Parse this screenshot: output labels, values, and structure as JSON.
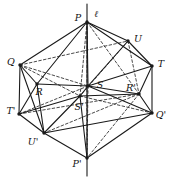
{
  "figure": {
    "type": "geometric-diagram",
    "stroke_color": "#1a1a1a",
    "background_color": "#ffffff",
    "width": 172,
    "height": 180,
    "axis": {
      "label": "ℓ",
      "label_x": 96,
      "label_y": 14,
      "x": 87,
      "y_top": 4,
      "y_bottom": 176
    },
    "points": [
      {
        "id": "P",
        "label": "P",
        "x": 87,
        "y": 22,
        "lx": 78,
        "ly": 18,
        "dot": true
      },
      {
        "id": "Q",
        "label": "Q",
        "x": 20,
        "y": 65,
        "lx": 11,
        "ly": 62,
        "dot": true
      },
      {
        "id": "U",
        "label": "U",
        "x": 128,
        "y": 41,
        "lx": 138,
        "ly": 39,
        "dot": true
      },
      {
        "id": "T",
        "label": "T",
        "x": 152,
        "y": 66,
        "lx": 161,
        "ly": 64,
        "dot": true
      },
      {
        "id": "R",
        "label": "R",
        "x": 37,
        "y": 84,
        "lx": 39,
        "ly": 92,
        "dot": true
      },
      {
        "id": "S",
        "label": "S",
        "x": 88,
        "y": 86,
        "lx": 100,
        "ly": 85,
        "dot": true
      },
      {
        "id": "Rp",
        "label": "R'",
        "x": 139,
        "y": 94,
        "lx": 131,
        "ly": 88,
        "dot": true
      },
      {
        "id": "Sp",
        "label": "S'",
        "x": 80,
        "y": 96,
        "lx": 79,
        "ly": 107,
        "dot": true
      },
      {
        "id": "Tp",
        "label": "T'",
        "x": 19,
        "y": 114,
        "lx": 11,
        "ly": 111,
        "dot": true
      },
      {
        "id": "Up",
        "label": "U'",
        "x": 44,
        "y": 133,
        "lx": 33,
        "ly": 142,
        "dot": true
      },
      {
        "id": "Qp",
        "label": "Q'",
        "x": 152,
        "y": 113,
        "lx": 161,
        "ly": 115,
        "dot": true
      },
      {
        "id": "Pp",
        "label": "P'",
        "x": 87,
        "y": 158,
        "lx": 77,
        "ly": 164,
        "dot": true
      }
    ],
    "solid_edges": [
      [
        "P",
        "Q"
      ],
      [
        "P",
        "U"
      ],
      [
        "P",
        "T"
      ],
      [
        "P",
        "R"
      ],
      [
        "P",
        "S"
      ],
      [
        "Q",
        "R"
      ],
      [
        "Q",
        "Tp"
      ],
      [
        "Q",
        "Up"
      ],
      [
        "U",
        "T"
      ],
      [
        "U",
        "S"
      ],
      [
        "T",
        "S"
      ],
      [
        "T",
        "Qp"
      ],
      [
        "R",
        "S"
      ],
      [
        "R",
        "Tp"
      ],
      [
        "R",
        "Up"
      ],
      [
        "S",
        "Rp"
      ],
      [
        "S",
        "Qp"
      ],
      [
        "S",
        "Sp"
      ],
      [
        "Rp",
        "T"
      ],
      [
        "Rp",
        "Qp"
      ],
      [
        "Sp",
        "Up"
      ],
      [
        "Sp",
        "Tp"
      ],
      [
        "Sp",
        "Rp"
      ],
      [
        "Tp",
        "Up"
      ],
      [
        "Up",
        "Pp"
      ],
      [
        "Up",
        "Qp"
      ],
      [
        "Qp",
        "Pp"
      ],
      [
        "Pp",
        "Sp"
      ]
    ],
    "dashed_edges": [
      [
        "P",
        "Sp"
      ],
      [
        "P",
        "Rp"
      ],
      [
        "P",
        "Pp"
      ],
      [
        "Q",
        "S"
      ],
      [
        "Q",
        "U"
      ],
      [
        "Q",
        "Sp"
      ],
      [
        "U",
        "Sp"
      ],
      [
        "U",
        "Rp"
      ],
      [
        "Rp",
        "Up"
      ],
      [
        "Rp",
        "Pp"
      ],
      [
        "Sp",
        "Qp"
      ],
      [
        "Tp",
        "Rp"
      ],
      [
        "S",
        "Pp"
      ],
      [
        "Tp",
        "S"
      ]
    ]
  }
}
